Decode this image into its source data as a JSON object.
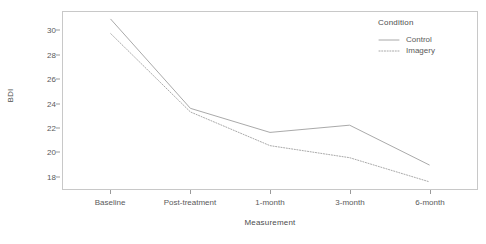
{
  "chart_data": {
    "type": "line",
    "title": "",
    "xlabel": "Measurement",
    "ylabel": "BDI",
    "categories": [
      "Baseline",
      "Post-treatment",
      "1-month",
      "3-month",
      "6-month"
    ],
    "series": [
      {
        "name": "Control",
        "values": [
          31.0,
          23.6,
          21.6,
          22.2,
          18.9
        ],
        "linestyle": "solid",
        "color": "#9e9e9e"
      },
      {
        "name": "Imagery",
        "values": [
          29.8,
          23.3,
          20.5,
          19.5,
          17.5
        ],
        "linestyle": "dotted",
        "color": "#9e9e9e"
      }
    ],
    "ylim": [
      16.9,
      31.6
    ],
    "yticks": [
      18,
      20,
      22,
      24,
      26,
      28,
      30
    ],
    "ytick_labels": [
      "18",
      "20",
      "22",
      "24",
      "26",
      "28",
      "30"
    ],
    "grid": false,
    "legend": {
      "title": "Condition",
      "position": "right",
      "entries": [
        {
          "label": "Control",
          "linestyle": "solid"
        },
        {
          "label": "Imagery",
          "linestyle": "dotted"
        }
      ]
    },
    "panel_border_color": "#c8c8c8",
    "background_color": "#ffffff",
    "axis_text_color": "#5a5a5a"
  }
}
